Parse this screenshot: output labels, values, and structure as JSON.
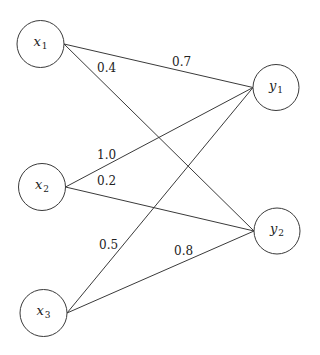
{
  "diagram": {
    "type": "bipartite-weighted-graph",
    "nodes": [
      {
        "id": "x1",
        "base": "x",
        "sub": "1",
        "cx": 40.5,
        "cy": 44,
        "r": 23.5
      },
      {
        "id": "x2",
        "base": "x",
        "sub": "2",
        "cx": 42,
        "cy": 187,
        "r": 23.5
      },
      {
        "id": "x3",
        "base": "x",
        "sub": "3",
        "cx": 43.5,
        "cy": 313,
        "r": 23.5
      },
      {
        "id": "y1",
        "base": "y",
        "sub": "1",
        "cx": 276,
        "cy": 87.5,
        "r": 23
      },
      {
        "id": "y2",
        "base": "y",
        "sub": "2",
        "cx": 277,
        "cy": 231,
        "r": 23
      }
    ],
    "edges": [
      {
        "from": "x1",
        "to": "y1",
        "weight": "0.7",
        "lx": 172,
        "ly": 66
      },
      {
        "from": "x1",
        "to": "y2",
        "weight": "0.4",
        "lx": 97,
        "ly": 72
      },
      {
        "from": "x2",
        "to": "y1",
        "weight": "1.0",
        "lx": 97,
        "ly": 159
      },
      {
        "from": "x2",
        "to": "y2",
        "weight": "0.2",
        "lx": 97,
        "ly": 185
      },
      {
        "from": "x3",
        "to": "y1",
        "weight": "0.5",
        "lx": 99,
        "ly": 249
      },
      {
        "from": "x3",
        "to": "y2",
        "weight": "0.8",
        "lx": 174,
        "ly": 255
      }
    ]
  }
}
